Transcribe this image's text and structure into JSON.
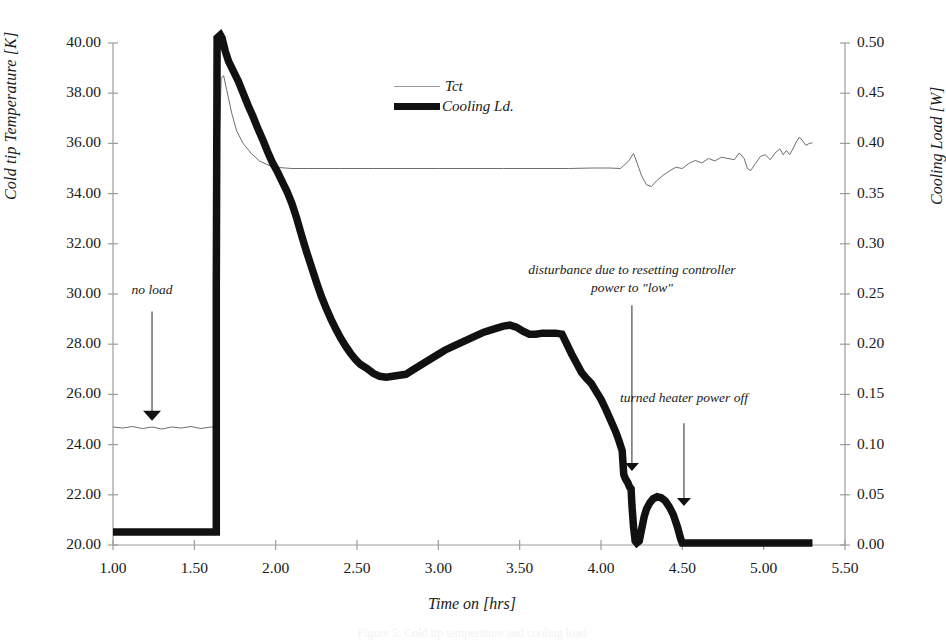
{
  "chart_data": {
    "type": "line",
    "title": "",
    "xlabel": "Time on [hrs]",
    "ylabel_left": "Cold tip Temperature [K]",
    "ylabel_right": "Cooling Load [W]",
    "xlim": [
      1.0,
      5.5
    ],
    "xticks": [
      "1.00",
      "1.50",
      "2.00",
      "2.50",
      "3.00",
      "3.50",
      "4.00",
      "4.50",
      "5.00",
      "5.50"
    ],
    "ylim_left": [
      20.0,
      40.0
    ],
    "yticks_left": [
      "20.00",
      "22.00",
      "24.00",
      "26.00",
      "28.00",
      "30.00",
      "32.00",
      "34.00",
      "36.00",
      "38.00",
      "40.00"
    ],
    "ylim_right": [
      0.0,
      0.5
    ],
    "yticks_right": [
      "0.00",
      "0.05",
      "0.10",
      "0.15",
      "0.20",
      "0.25",
      "0.30",
      "0.35",
      "0.40",
      "0.45",
      "0.50"
    ],
    "grid": false,
    "legend_position": "upper-center",
    "series": [
      {
        "name": "Tct",
        "axis": "left",
        "style": "thin-line",
        "color": "#6e6e6e",
        "points": [
          [
            1.0,
            24.7
          ],
          [
            1.06,
            24.66
          ],
          [
            1.12,
            24.72
          ],
          [
            1.18,
            24.64
          ],
          [
            1.24,
            24.7
          ],
          [
            1.3,
            24.62
          ],
          [
            1.36,
            24.7
          ],
          [
            1.42,
            24.66
          ],
          [
            1.48,
            24.72
          ],
          [
            1.54,
            24.64
          ],
          [
            1.6,
            24.7
          ],
          [
            1.63,
            24.7
          ],
          [
            1.645,
            31.0
          ],
          [
            1.655,
            36.5
          ],
          [
            1.665,
            38.6
          ],
          [
            1.68,
            38.7
          ],
          [
            1.7,
            38.1
          ],
          [
            1.73,
            37.2
          ],
          [
            1.76,
            36.5
          ],
          [
            1.8,
            36.0
          ],
          [
            1.85,
            35.6
          ],
          [
            1.9,
            35.3
          ],
          [
            1.96,
            35.12
          ],
          [
            2.02,
            35.04
          ],
          [
            2.1,
            35.0
          ],
          [
            2.2,
            35.0
          ],
          [
            2.4,
            35.0
          ],
          [
            2.6,
            35.0
          ],
          [
            2.8,
            35.0
          ],
          [
            3.0,
            35.0
          ],
          [
            3.2,
            35.0
          ],
          [
            3.4,
            35.0
          ],
          [
            3.6,
            35.0
          ],
          [
            3.8,
            35.0
          ],
          [
            3.95,
            35.02
          ],
          [
            4.05,
            35.02
          ],
          [
            4.12,
            35.0
          ],
          [
            4.17,
            35.3
          ],
          [
            4.2,
            35.6
          ],
          [
            4.22,
            35.25
          ],
          [
            4.25,
            34.7
          ],
          [
            4.28,
            34.35
          ],
          [
            4.31,
            34.28
          ],
          [
            4.34,
            34.5
          ],
          [
            4.38,
            34.72
          ],
          [
            4.42,
            34.9
          ],
          [
            4.46,
            35.05
          ],
          [
            4.5,
            35.0
          ],
          [
            4.54,
            35.2
          ],
          [
            4.58,
            35.32
          ],
          [
            4.62,
            35.22
          ],
          [
            4.66,
            35.4
          ],
          [
            4.7,
            35.3
          ],
          [
            4.74,
            35.45
          ],
          [
            4.78,
            35.4
          ],
          [
            4.82,
            35.35
          ],
          [
            4.85,
            35.62
          ],
          [
            4.88,
            35.4
          ],
          [
            4.9,
            35.0
          ],
          [
            4.92,
            34.92
          ],
          [
            4.95,
            35.2
          ],
          [
            4.98,
            35.48
          ],
          [
            5.01,
            35.55
          ],
          [
            5.04,
            35.35
          ],
          [
            5.07,
            35.62
          ],
          [
            5.1,
            35.78
          ],
          [
            5.12,
            35.55
          ],
          [
            5.14,
            35.72
          ],
          [
            5.16,
            35.55
          ],
          [
            5.18,
            35.78
          ],
          [
            5.2,
            36.05
          ],
          [
            5.22,
            36.25
          ],
          [
            5.24,
            36.1
          ],
          [
            5.26,
            35.92
          ],
          [
            5.28,
            36.0
          ],
          [
            5.3,
            36.02
          ]
        ]
      },
      {
        "name": "Cooling Ld.",
        "axis": "right",
        "style": "thick-line",
        "color": "#111111",
        "points": [
          [
            1.0,
            0.013
          ],
          [
            1.2,
            0.013
          ],
          [
            1.4,
            0.013
          ],
          [
            1.6,
            0.013
          ],
          [
            1.635,
            0.013
          ],
          [
            1.635,
            0.255
          ],
          [
            1.64,
            0.505
          ],
          [
            1.66,
            0.508
          ],
          [
            1.67,
            0.505
          ],
          [
            1.69,
            0.492
          ],
          [
            1.71,
            0.482
          ],
          [
            1.74,
            0.472
          ],
          [
            1.77,
            0.462
          ],
          [
            1.8,
            0.45
          ],
          [
            1.83,
            0.438
          ],
          [
            1.86,
            0.427
          ],
          [
            1.89,
            0.415
          ],
          [
            1.92,
            0.404
          ],
          [
            1.95,
            0.392
          ],
          [
            1.98,
            0.381
          ],
          [
            2.01,
            0.372
          ],
          [
            2.04,
            0.362
          ],
          [
            2.07,
            0.352
          ],
          [
            2.1,
            0.34
          ],
          [
            2.13,
            0.325
          ],
          [
            2.16,
            0.308
          ],
          [
            2.19,
            0.292
          ],
          [
            2.22,
            0.277
          ],
          [
            2.25,
            0.262
          ],
          [
            2.28,
            0.248
          ],
          [
            2.31,
            0.236
          ],
          [
            2.34,
            0.225
          ],
          [
            2.37,
            0.215
          ],
          [
            2.4,
            0.206
          ],
          [
            2.43,
            0.198
          ],
          [
            2.46,
            0.191
          ],
          [
            2.49,
            0.185
          ],
          [
            2.52,
            0.18
          ],
          [
            2.56,
            0.176
          ],
          [
            2.6,
            0.171
          ],
          [
            2.64,
            0.168
          ],
          [
            2.68,
            0.167
          ],
          [
            2.72,
            0.168
          ],
          [
            2.76,
            0.169
          ],
          [
            2.8,
            0.17
          ],
          [
            2.84,
            0.174
          ],
          [
            2.88,
            0.178
          ],
          [
            2.92,
            0.182
          ],
          [
            2.96,
            0.186
          ],
          [
            3.0,
            0.19
          ],
          [
            3.04,
            0.194
          ],
          [
            3.08,
            0.197
          ],
          [
            3.12,
            0.2
          ],
          [
            3.16,
            0.203
          ],
          [
            3.2,
            0.206
          ],
          [
            3.24,
            0.209
          ],
          [
            3.28,
            0.212
          ],
          [
            3.32,
            0.214
          ],
          [
            3.36,
            0.216
          ],
          [
            3.4,
            0.218
          ],
          [
            3.44,
            0.219
          ],
          [
            3.48,
            0.217
          ],
          [
            3.52,
            0.213
          ],
          [
            3.56,
            0.21
          ],
          [
            3.6,
            0.21
          ],
          [
            3.64,
            0.211
          ],
          [
            3.68,
            0.211
          ],
          [
            3.72,
            0.211
          ],
          [
            3.76,
            0.21
          ],
          [
            3.79,
            0.2
          ],
          [
            3.82,
            0.19
          ],
          [
            3.85,
            0.181
          ],
          [
            3.88,
            0.172
          ],
          [
            3.91,
            0.166
          ],
          [
            3.94,
            0.161
          ],
          [
            3.97,
            0.153
          ],
          [
            4.0,
            0.145
          ],
          [
            4.03,
            0.135
          ],
          [
            4.06,
            0.124
          ],
          [
            4.09,
            0.113
          ],
          [
            4.11,
            0.104
          ],
          [
            4.13,
            0.094
          ],
          [
            4.14,
            0.07
          ],
          [
            4.15,
            0.066
          ],
          [
            4.165,
            0.062
          ],
          [
            4.175,
            0.058
          ],
          [
            4.185,
            0.056
          ],
          [
            4.19,
            0.04
          ],
          [
            4.2,
            0.018
          ],
          [
            4.21,
            0.004
          ],
          [
            4.22,
            0.002
          ],
          [
            4.235,
            0.004
          ],
          [
            4.25,
            0.016
          ],
          [
            4.265,
            0.028
          ],
          [
            4.28,
            0.036
          ],
          [
            4.3,
            0.042
          ],
          [
            4.32,
            0.046
          ],
          [
            4.345,
            0.048
          ],
          [
            4.37,
            0.047
          ],
          [
            4.395,
            0.044
          ],
          [
            4.42,
            0.038
          ],
          [
            4.445,
            0.03
          ],
          [
            4.47,
            0.018
          ],
          [
            4.49,
            0.006
          ],
          [
            4.5,
            0.002
          ],
          [
            4.52,
            0.002
          ],
          [
            4.7,
            0.002
          ],
          [
            4.9,
            0.002
          ],
          [
            5.1,
            0.002
          ],
          [
            5.3,
            0.002
          ]
        ]
      }
    ],
    "annotations": [
      {
        "id": "no-load",
        "text": "no load",
        "x": 1.24,
        "y_left": 29.9,
        "arrow_to_y_left": 24.9
      },
      {
        "id": "disturbance",
        "line1": "disturbance due to resetting controller",
        "line2": "power to \"low\"",
        "x": 4.19,
        "y_left": 30.4,
        "arrow_to_y_left": 22.9
      },
      {
        "id": "heater-off",
        "text": "turned heater power off",
        "x": 4.51,
        "y_left": 25.6,
        "arrow_to_y_left": 21.5
      }
    ],
    "legend": [
      {
        "name": "Tct",
        "style": "thin"
      },
      {
        "name": "Cooling Ld.",
        "style": "thick"
      }
    ]
  },
  "caption": "Figure 5: Cold tip temperature and cooling load"
}
